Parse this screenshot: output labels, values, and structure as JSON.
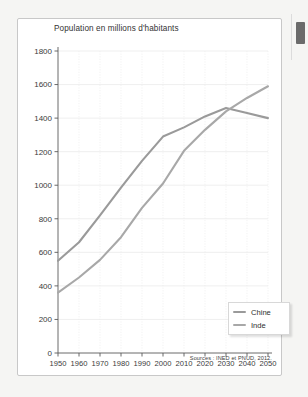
{
  "chart_data": {
    "type": "line",
    "title": "Population en millions d'habitants",
    "xlabel": "",
    "ylabel": "",
    "xlim": [
      1950,
      2050
    ],
    "ylim": [
      0,
      1800
    ],
    "grid": true,
    "legend_position": "bottom-right",
    "x": [
      1950,
      1960,
      1970,
      1980,
      1990,
      2000,
      2010,
      2020,
      2030,
      2040,
      2050
    ],
    "xtick_labels": [
      "1950",
      "1960",
      "1970",
      "1980",
      "1990",
      "2000",
      "2010",
      "2020",
      "2030",
      "2040",
      "2050"
    ],
    "ytick_labels": [
      "0",
      "200",
      "400",
      "600",
      "800",
      "1000",
      "1200",
      "1400",
      "1600",
      "1800"
    ],
    "ytick_values": [
      0,
      200,
      400,
      600,
      800,
      1000,
      1200,
      1400,
      1600,
      1800
    ],
    "series": [
      {
        "name": "Chine",
        "color": "#9a9a9a",
        "values": [
          550,
          660,
          820,
          985,
          1145,
          1290,
          1345,
          1410,
          1460,
          1430,
          1400
        ]
      },
      {
        "name": "Inde",
        "color": "#a8a8a8",
        "values": [
          360,
          450,
          555,
          690,
          865,
          1010,
          1205,
          1330,
          1440,
          1520,
          1590
        ]
      }
    ],
    "annotations": {
      "source": "Sources : INED et PNUD, 2012."
    }
  },
  "legend": {
    "items": [
      {
        "label": "Chine"
      },
      {
        "label": "Inde"
      }
    ]
  }
}
